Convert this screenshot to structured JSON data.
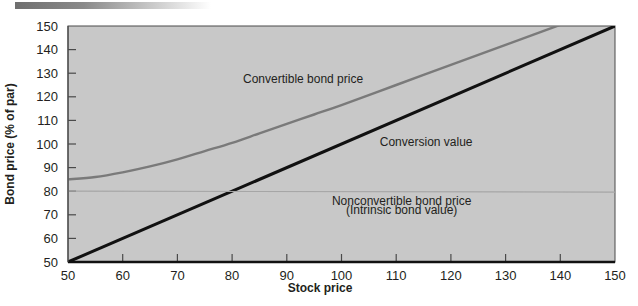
{
  "figure": {
    "background_color": "#ffffff",
    "plot_background_color": "#c8c8c8",
    "top_rule_label": "decorative-gradient-rule"
  },
  "chart_data": {
    "type": "line",
    "title": "",
    "subtitle": "",
    "xlabel": "Stock price",
    "ylabel": "Bond price (% of par)",
    "xlim": [
      50,
      150
    ],
    "ylim": [
      50,
      150
    ],
    "xticks": [
      50,
      60,
      70,
      80,
      90,
      100,
      110,
      120,
      130,
      140,
      150
    ],
    "yticks": [
      50,
      60,
      70,
      80,
      90,
      100,
      110,
      120,
      130,
      140,
      150
    ],
    "xtick_labels": [
      "50",
      "60",
      "70",
      "80",
      "90",
      "100",
      "110",
      "120",
      "130",
      "140",
      "150"
    ],
    "ytick_labels": [
      "50",
      "60",
      "70",
      "80",
      "90",
      "100",
      "110",
      "120",
      "130",
      "140",
      "150"
    ],
    "grid": false,
    "legend_position": "inline-annotations",
    "series": [
      {
        "name": "Convertible bond price",
        "color": "#7a7a7a",
        "width": 2.4,
        "x": [
          50,
          55,
          60,
          65,
          70,
          75,
          80,
          85,
          90,
          95,
          100,
          110,
          120,
          130,
          140,
          150
        ],
        "values": [
          85,
          86,
          88,
          90.5,
          93.5,
          97,
          100.5,
          104.5,
          108.5,
          112.5,
          116.5,
          125,
          133.5,
          142,
          150.5,
          159
        ]
      },
      {
        "name": "Conversion value",
        "color": "#111111",
        "width": 3.0,
        "x": [
          50,
          150
        ],
        "values": [
          50,
          150
        ]
      },
      {
        "name": "Nonconvertible bond price",
        "color": "#a6a6a6",
        "width": 1.2,
        "x": [
          50,
          150
        ],
        "values": [
          80,
          79.6
        ]
      }
    ],
    "annotations": [
      {
        "text": "Convertible bond price",
        "x": 82,
        "y": 126,
        "anchor": "start"
      },
      {
        "text": "Conversion value",
        "x": 107,
        "y": 99,
        "anchor": "start"
      },
      {
        "text": "Nonconvertible bond price",
        "x": 111,
        "y": 74,
        "anchor": "middle"
      },
      {
        "text": "(Intrinsic bond value)",
        "x": 111,
        "y": 70.5,
        "anchor": "middle"
      }
    ]
  }
}
